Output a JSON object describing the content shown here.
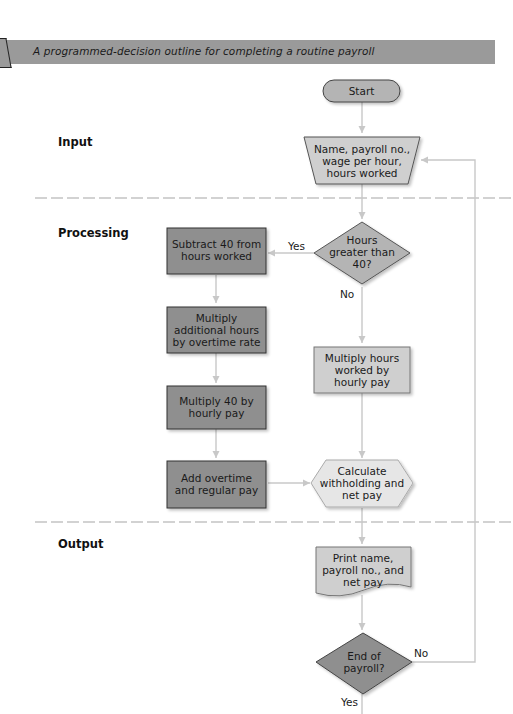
{
  "title": "A programmed-decision outline for completing a routine payroll",
  "sections": {
    "input": "Input",
    "processing": "Processing",
    "output": "Output"
  },
  "nodes": {
    "start": {
      "shape": "terminator",
      "lines": [
        "Start"
      ]
    },
    "input_data": {
      "shape": "manual-input-trapezoid",
      "lines": [
        "Name, payroll no.,",
        "wage per hour,",
        "hours worked"
      ]
    },
    "hours_check": {
      "shape": "decision",
      "lines": [
        "Hours",
        "greater than",
        "40?"
      ]
    },
    "subtract": {
      "shape": "process-dark",
      "lines": [
        "Subtract 40 from",
        "hours worked"
      ]
    },
    "multiply_overtime": {
      "shape": "process-dark",
      "lines": [
        "Multiply",
        "additional hours",
        "by overtime rate"
      ]
    },
    "multiply_40": {
      "shape": "process-dark",
      "lines": [
        "Multiply 40 by",
        "hourly pay"
      ]
    },
    "add_pay": {
      "shape": "process-dark",
      "lines": [
        "Add overtime",
        "and regular pay"
      ]
    },
    "multiply_hours": {
      "shape": "process-light",
      "lines": [
        "Multiply hours",
        "worked by",
        "hourly pay"
      ]
    },
    "calculate": {
      "shape": "preparation-hexagon",
      "lines": [
        "Calculate",
        "withholding and",
        "net pay"
      ]
    },
    "print": {
      "shape": "document",
      "lines": [
        "Print name,",
        "payroll no., and",
        "net pay"
      ]
    },
    "end_check": {
      "shape": "decision-dark",
      "lines": [
        "End of",
        "payroll?"
      ]
    }
  },
  "edge_labels": {
    "hours_yes": "Yes",
    "hours_no": "No",
    "end_no": "No",
    "end_yes": "Yes"
  },
  "colors": {
    "banner": "#9a9a9a",
    "dark_fill": "#8f8f8f",
    "mid_fill": "#b4b4b4",
    "light_fill": "#cfcfcf",
    "lighter_fill": "#e6e6e6",
    "connector": "#c8c8c8",
    "divider": "#c4c4c4"
  }
}
